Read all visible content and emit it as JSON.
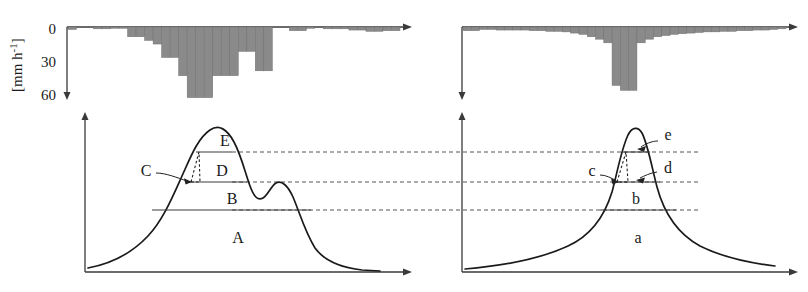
{
  "figure": {
    "type": "two-panel hydrology diagram",
    "panels": [
      "left",
      "right"
    ]
  },
  "left_panel": {
    "hyetograph": {
      "y_axis_label": "[mm h-1]",
      "y_axis_label_parts": {
        "main": "[mm h",
        "exponent": "-1",
        "tail": "]"
      },
      "ticks": [
        "0",
        "30",
        "60"
      ],
      "tick_values": [
        0,
        30,
        60
      ],
      "axis_direction": "downward",
      "max_intensity": 60
    },
    "hydrograph": {
      "zone_labels": [
        "A",
        "B",
        "C",
        "D",
        "E"
      ],
      "inside_labels": [
        "A",
        "B",
        "D",
        "E"
      ],
      "leader_labels": [
        "C"
      ],
      "shape": "broad double peak"
    }
  },
  "right_panel": {
    "hyetograph": {
      "ticks": [],
      "axis_direction": "downward",
      "max_intensity": 60
    },
    "hydrograph": {
      "zone_labels": [
        "a",
        "b",
        "c",
        "d",
        "e"
      ],
      "inside_labels": [
        "a",
        "b"
      ],
      "leader_labels": [
        "c",
        "d",
        "e"
      ],
      "shape": "sharp single peak"
    }
  },
  "colors": {
    "bar_fill": "#8a8a8a",
    "bar_stroke": "#6f6f6f",
    "curve": "#1a1a1a",
    "axis": "#3a3a3a",
    "dashed_link": "#555555"
  },
  "chart_data": {
    "type": "bar",
    "title": "",
    "xlabel": "",
    "ylabel": "[mm h-1]",
    "ylim": [
      0,
      60
    ],
    "grid": false,
    "legend": "none",
    "inverted_yaxis": true,
    "series": [
      {
        "name": "left hyetograph rainfall intensity",
        "values": [
          2,
          0,
          0,
          1.5,
          1.5,
          1,
          1,
          8,
          8,
          11,
          14,
          25,
          25,
          40,
          58,
          58,
          58,
          40,
          40,
          40,
          20,
          20,
          36,
          36,
          0,
          0,
          3,
          3,
          1,
          0,
          1.5,
          1.5,
          1.5,
          2.5,
          2.5,
          3.5,
          3.5,
          3,
          3
        ]
      },
      {
        "name": "right hyetograph rainfall intensity",
        "values": [
          3,
          3,
          2,
          2,
          2.5,
          2.5,
          2.5,
          2.5,
          3,
          3,
          3.5,
          3.5,
          4,
          5,
          6,
          8,
          10,
          13,
          48,
          52,
          52,
          13,
          10,
          8,
          7,
          6,
          5.5,
          5,
          4.5,
          4,
          4,
          3.5,
          3.5,
          3,
          3,
          2.5,
          2.5,
          2,
          1.5
        ]
      }
    ],
    "hydrographs": [
      {
        "name": "left hydrograph",
        "shape": "broad double peak",
        "separation_levels": [
          3
        ],
        "zones": [
          "A",
          "B",
          "C",
          "D",
          "E"
        ]
      },
      {
        "name": "right hydrograph",
        "shape": "sharp narrow peak",
        "separation_levels": [
          3
        ],
        "zones": [
          "a",
          "b",
          "c",
          "d",
          "e"
        ]
      }
    ]
  }
}
